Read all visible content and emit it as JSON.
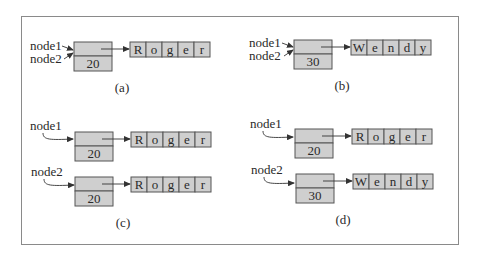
{
  "colors": {
    "fill": "#cfcfcf",
    "stroke": "#555555",
    "frame": "#8a8a8a",
    "text": "#2a2a2a"
  },
  "panels": [
    {
      "caption": "(a)",
      "refs": [
        "node1",
        "node2"
      ],
      "nodes": [
        {
          "value": "20",
          "array": [
            "R",
            "o",
            "g",
            "e",
            "r"
          ],
          "pointed_by": [
            "node1",
            "node2"
          ]
        }
      ]
    },
    {
      "caption": "(b)",
      "refs": [
        "node1",
        "node2"
      ],
      "nodes": [
        {
          "value": "30",
          "array": [
            "W",
            "e",
            "n",
            "d",
            "y"
          ],
          "pointed_by": [
            "node1",
            "node2"
          ]
        }
      ]
    },
    {
      "caption": "(c)",
      "refs": [
        "node1",
        "node2"
      ],
      "nodes": [
        {
          "value": "20",
          "array": [
            "R",
            "o",
            "g",
            "e",
            "r"
          ],
          "pointed_by": [
            "node1"
          ]
        },
        {
          "value": "20",
          "array": [
            "R",
            "o",
            "g",
            "e",
            "r"
          ],
          "pointed_by": [
            "node2"
          ]
        }
      ]
    },
    {
      "caption": "(d)",
      "refs": [
        "node1",
        "node2"
      ],
      "nodes": [
        {
          "value": "20",
          "array": [
            "R",
            "o",
            "g",
            "e",
            "r"
          ],
          "pointed_by": [
            "node1"
          ]
        },
        {
          "value": "30",
          "array": [
            "W",
            "e",
            "n",
            "d",
            "y"
          ],
          "pointed_by": [
            "node2"
          ]
        }
      ]
    }
  ]
}
